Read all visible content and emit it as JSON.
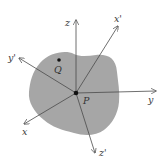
{
  "diagram": {
    "colors": {
      "background": "#ffffff",
      "body_fill": "#a6a6a6",
      "axis_stroke": "#4a4a4a",
      "point_fill": "#111111",
      "label_color": "#3a3a3a"
    },
    "body": {
      "shape": "irregular-blob",
      "label": ""
    },
    "points": {
      "P": {
        "label": "P",
        "x": 76,
        "y": 93
      },
      "Q": {
        "label": "Q",
        "x": 59,
        "y": 60
      }
    },
    "frame_unprimed": {
      "z": {
        "label": "z",
        "tip": [
          76,
          20
        ]
      },
      "y": {
        "label": "y",
        "tip": [
          156,
          91
        ]
      },
      "x": {
        "label": "x",
        "tip": [
          24,
          124
        ]
      }
    },
    "frame_primed": {
      "x_prime": {
        "label": "x'",
        "tip": [
          118,
          26
        ]
      },
      "y_prime": {
        "label": "y'",
        "tip": [
          19,
          58
        ]
      },
      "z_prime": {
        "label": "z'",
        "tip": [
          95,
          153
        ]
      }
    }
  }
}
